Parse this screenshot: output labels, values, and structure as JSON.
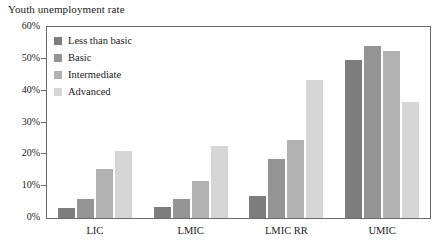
{
  "chart_data": {
    "type": "bar",
    "title": "Youth unemployment rate",
    "xlabel": "",
    "ylabel": "",
    "ylim": [
      0,
      60
    ],
    "ytick_labels": [
      "60%",
      "50%",
      "40%",
      "30%",
      "20%",
      "10%",
      "0%"
    ],
    "ytick_values": [
      60,
      50,
      40,
      30,
      20,
      10,
      0
    ],
    "grid": false,
    "legend_position": "top-left-inside",
    "categories": [
      "LIC",
      "LMIC",
      "LMIC RR",
      "UMIC"
    ],
    "series": [
      {
        "name": "Less than basic",
        "color": "#7d7d7d",
        "values": [
          3.0,
          3.5,
          6.8,
          49.5
        ]
      },
      {
        "name": "Basic",
        "color": "#949494",
        "values": [
          6.0,
          6.0,
          18.5,
          54.0
        ]
      },
      {
        "name": "Intermediate",
        "color": "#b2b2b2",
        "values": [
          15.5,
          11.5,
          24.5,
          52.5
        ]
      },
      {
        "name": "Advanced",
        "color": "#d6d6d6",
        "values": [
          21.0,
          22.5,
          43.5,
          36.5
        ]
      }
    ]
  },
  "axis": {
    "frame_color": "#6b6b6b"
  }
}
